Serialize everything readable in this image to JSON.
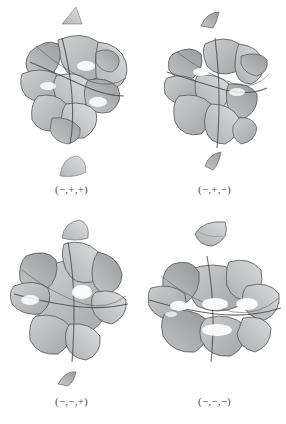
{
  "plate": {
    "background_color": "#ffffff",
    "layout": "2x2-grid",
    "ink_color": "#55575a",
    "edge_color": "#2f3134",
    "fill_light": "#d8d9da",
    "fill_mid": "#b3b5b7",
    "fill_dark": "#8d8f91"
  },
  "figures": [
    {
      "id": "figure-top-left",
      "caption": "(−,+,+)",
      "position": "top-left",
      "surface_name": "algebraic-surface-mpp",
      "fragment_count": 2,
      "fragments": [
        "top-triangular-sliver",
        "bottom-rounded-cap"
      ]
    },
    {
      "id": "figure-top-right",
      "caption": "(−,+,−)",
      "position": "top-right",
      "surface_name": "algebraic-surface-mpm",
      "fragment_count": 2,
      "fragments": [
        "top-wedge-sliver",
        "bottom-wedge-sliver"
      ]
    },
    {
      "id": "figure-bottom-left",
      "caption": "(−,−,+)",
      "position": "bottom-left",
      "surface_name": "algebraic-surface-mmp",
      "fragment_count": 2,
      "fragments": [
        "top-rounded-cap",
        "bottom-triangular-sliver"
      ]
    },
    {
      "id": "figure-bottom-right",
      "caption": "(−,−,−)",
      "position": "bottom-right",
      "surface_name": "algebraic-surface-mmm",
      "fragment_count": 1,
      "fragments": [
        "top-crescent-cap"
      ]
    }
  ]
}
